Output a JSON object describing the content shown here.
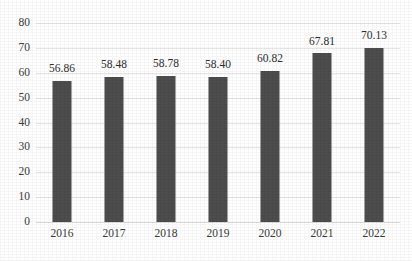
{
  "chart_data": {
    "type": "bar",
    "title": "",
    "subtitle": "",
    "xlabel": "",
    "ylabel": "",
    "categories": [
      "2016",
      "2017",
      "2018",
      "2019",
      "2020",
      "2021",
      "2022"
    ],
    "values": [
      56.86,
      58.48,
      58.78,
      58.4,
      60.82,
      67.81,
      70.13
    ],
    "data_labels": [
      "56.86",
      "58.48",
      "58.78",
      "58.40",
      "60.82",
      "67.81",
      "70.13"
    ],
    "ylim": [
      0,
      80
    ],
    "ytick_values": [
      0,
      10,
      20,
      30,
      40,
      50,
      60,
      70,
      80
    ],
    "ytick_labels": [
      "0",
      "10",
      "20",
      "30",
      "40",
      "50",
      "60",
      "70",
      "80"
    ],
    "grid": "horizontal",
    "legend": "none",
    "legend_entries": [],
    "annotations": [],
    "series": [
      {
        "name": "",
        "values": [
          56.86,
          58.48,
          58.78,
          58.4,
          60.82,
          67.81,
          70.13
        ],
        "color": "#4d4d4d"
      }
    ],
    "colors": {
      "bar": "#4d4d4d",
      "gridline": "#e6e6e6",
      "baseline": "#d9d9d9",
      "text": "#3b3b3b",
      "background": "#ffffff"
    }
  }
}
